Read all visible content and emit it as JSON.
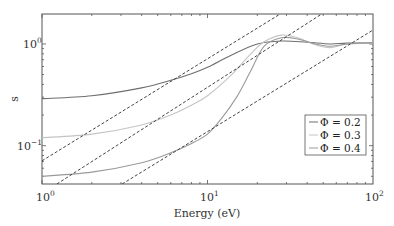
{
  "chart_data": {
    "type": "line",
    "title": "",
    "xlabel": "Energy (eV)",
    "ylabel": "s",
    "xscale": "log",
    "yscale": "log",
    "xlim": [
      1,
      100
    ],
    "ylim": [
      0.042,
      1.97
    ],
    "grid": false,
    "legend_position": "lower right",
    "x_ticks": [
      "10^0",
      "10^1",
      "10^2"
    ],
    "y_ticks": [
      "10^-1",
      "10^0"
    ],
    "series": [
      {
        "name": "Φ = 0.2",
        "color": "#6e6e6e",
        "style": "solid",
        "x": [
          1,
          2,
          4,
          6,
          8,
          10,
          14,
          20,
          28,
          40,
          55,
          70,
          100
        ],
        "y": [
          0.29,
          0.31,
          0.37,
          0.44,
          0.51,
          0.59,
          0.78,
          1.0,
          1.07,
          1.04,
          1.0,
          1.02,
          1.02
        ]
      },
      {
        "name": "Φ = 0.3",
        "color": "#c4c4c4",
        "style": "solid",
        "x": [
          1,
          2,
          4,
          6,
          8,
          10,
          14,
          18,
          22,
          28,
          35,
          45,
          55,
          70,
          100
        ],
        "y": [
          0.12,
          0.13,
          0.16,
          0.2,
          0.25,
          0.31,
          0.5,
          0.78,
          1.05,
          1.22,
          1.15,
          0.98,
          0.92,
          1.0,
          1.02
        ]
      },
      {
        "name": "Φ = 0.4",
        "color": "#9a9a9a",
        "style": "solid",
        "x": [
          1,
          2,
          4,
          6,
          8,
          10,
          12,
          15,
          18,
          22,
          28,
          35,
          45,
          55,
          70,
          100
        ],
        "y": [
          0.05,
          0.055,
          0.068,
          0.085,
          0.105,
          0.13,
          0.18,
          0.3,
          0.52,
          0.95,
          1.15,
          1.12,
          1.0,
          0.95,
          1.0,
          1.03
        ]
      },
      {
        "name": "guide-1",
        "color": "#444444",
        "style": "dashed",
        "x": [
          1,
          27.5
        ],
        "y": [
          0.071,
          1.97
        ]
      },
      {
        "name": "guide-2",
        "color": "#444444",
        "style": "dashed",
        "x": [
          1.23,
          49
        ],
        "y": [
          0.042,
          1.97
        ]
      },
      {
        "name": "guide-3",
        "color": "#444444",
        "style": "dashed",
        "x": [
          3.05,
          100
        ],
        "y": [
          0.042,
          1.37
        ]
      }
    ]
  },
  "legend": {
    "items": [
      {
        "label": "Φ = 0.2",
        "color": "#6e6e6e"
      },
      {
        "label": "Φ = 0.3",
        "color": "#c4c4c4"
      },
      {
        "label": "Φ = 0.4",
        "color": "#9a9a9a"
      }
    ]
  },
  "axes": {
    "xlabel": "Energy (eV)",
    "ylabel": "s",
    "x_tick_labels": [
      {
        "base": "10",
        "exp": "0"
      },
      {
        "base": "10",
        "exp": "1"
      },
      {
        "base": "10",
        "exp": "2"
      }
    ],
    "y_tick_labels": [
      {
        "base": "10",
        "exp": "0"
      },
      {
        "base": "10",
        "exp": "−1"
      }
    ]
  }
}
